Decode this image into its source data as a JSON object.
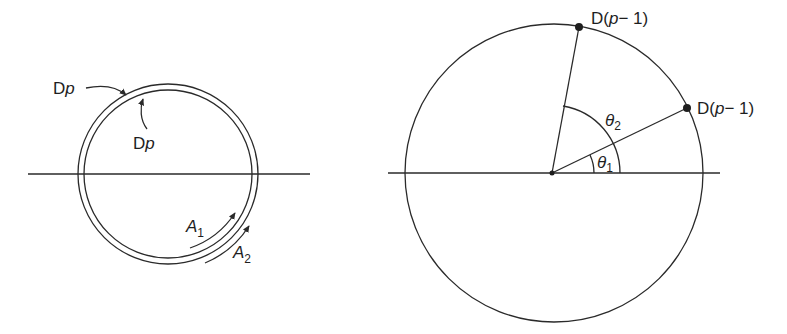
{
  "figure": {
    "left_panel": {
      "outer_ring_label": {
        "main": "D",
        "var": "p"
      },
      "inner_ring_label": {
        "main": "D",
        "var": "p"
      },
      "arc_labels": [
        {
          "main": "A",
          "sub": "1"
        },
        {
          "main": "A",
          "sub": "2"
        }
      ]
    },
    "right_panel": {
      "point_labels": [
        {
          "prefix": "D(",
          "var": "p",
          "suffix": "− 1)"
        },
        {
          "prefix": "D(",
          "var": "p",
          "suffix": "− 1)"
        }
      ],
      "angle_labels": [
        {
          "main": "θ",
          "sub": "1"
        },
        {
          "main": "θ",
          "sub": "2"
        }
      ]
    }
  }
}
